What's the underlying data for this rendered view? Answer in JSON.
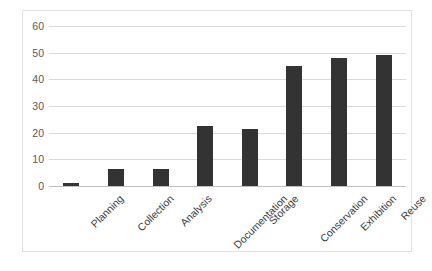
{
  "chart_data": {
    "type": "bar",
    "title": "",
    "subtitle": "",
    "xlabel": "",
    "ylabel": "",
    "categories": [
      "Planning",
      "Collection",
      "Analysis",
      "Documentation",
      "Storage",
      "Conservation",
      "Exhibition",
      "Reuse"
    ],
    "values": [
      1,
      6.5,
      6.5,
      22.5,
      21.5,
      45,
      48,
      49
    ],
    "series": [
      {
        "name": "",
        "values": [
          1,
          6.5,
          6.5,
          22.5,
          21.5,
          45,
          48,
          49
        ]
      }
    ],
    "ylim": [
      0,
      60
    ],
    "ytick_values": [
      0,
      10,
      20,
      30,
      40,
      50,
      60
    ],
    "ytick_labels": [
      "0",
      "10",
      "20",
      "30",
      "40",
      "50",
      "60"
    ],
    "xtick_label_rotation": -45,
    "grid": "horizontal",
    "legend": "none",
    "bar_color": "#333333",
    "gridline_color": "#d9d9d9",
    "axis_text_color": "#59595b",
    "frame_color": "#e2e2e2",
    "background_color": "#ffffff"
  }
}
